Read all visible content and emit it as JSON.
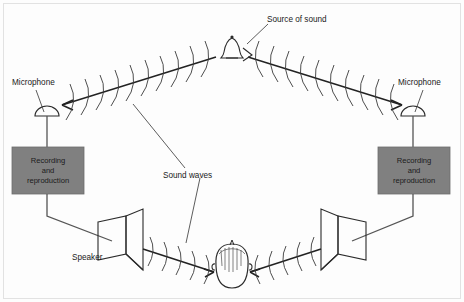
{
  "figure": {
    "background_color": "#fdfdfd",
    "ink_color": "#222222",
    "box_fill_color": "#808080"
  },
  "labels": {
    "source_of_sound": "Source of sound",
    "microphone_left": "Microphone",
    "microphone_right": "Microphone",
    "sound_waves": "Sound waves",
    "speaker": "Speaker",
    "recording_left": [
      "Recording",
      "and",
      "reproduction"
    ],
    "recording_right": [
      "Recording",
      "and",
      "reproduction"
    ]
  },
  "elements": {
    "source": {
      "name": "bell",
      "x": 232,
      "y": 52
    },
    "microphone_left": {
      "x": 47,
      "y": 117
    },
    "microphone_right": {
      "x": 413,
      "y": 117
    },
    "unit_left": {
      "x": 12,
      "y": 147,
      "w": 72,
      "h": 47
    },
    "unit_right": {
      "x": 378,
      "y": 147,
      "w": 72,
      "h": 47
    },
    "speaker_left": {
      "x": 125,
      "y": 238
    },
    "speaker_right": {
      "x": 345,
      "y": 238
    },
    "listener": {
      "x": 232,
      "y": 270
    }
  },
  "ray_paths": [
    {
      "name": "source-to-left-mic",
      "from": [
        218,
        56
      ],
      "to": [
        60,
        106
      ],
      "direction": "left-down"
    },
    {
      "name": "source-to-right-mic",
      "from": [
        246,
        56
      ],
      "to": [
        402,
        106
      ],
      "direction": "right-down"
    },
    {
      "name": "left-speaker-to-ear",
      "from": [
        148,
        247
      ],
      "to": [
        212,
        272
      ],
      "direction": "right-down"
    },
    {
      "name": "right-speaker-to-ear",
      "from": [
        322,
        247
      ],
      "to": [
        254,
        272
      ],
      "direction": "left-down"
    }
  ],
  "wire_paths": [
    {
      "name": "left-mic-to-unit",
      "points": "47,128 47,147"
    },
    {
      "name": "left-unit-to-speaker",
      "points": "47,194 47,215 113,240"
    },
    {
      "name": "right-mic-to-unit",
      "points": "413,128 413,147"
    },
    {
      "name": "right-unit-to-speaker",
      "points": "413,194 413,215 368,240"
    }
  ]
}
